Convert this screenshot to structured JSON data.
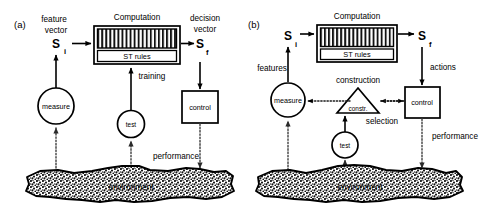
{
  "figure": {
    "panels": [
      {
        "tag": "(a)",
        "labels": {
          "input_caption_line1": "feature",
          "input_caption_line2": "vector",
          "input_symbol": "S",
          "input_subscript": "i",
          "output_caption_line1": "decision",
          "output_caption_line2": "vector",
          "output_symbol": "S",
          "output_subscript": "f",
          "computation": "Computation",
          "st_rules": "ST rules",
          "measure": "measure",
          "test": "test",
          "control": "control",
          "environment": "environment",
          "training": "training",
          "performance": "performance"
        }
      },
      {
        "tag": "(b)",
        "labels": {
          "input_caption": "features",
          "input_symbol": "S",
          "input_subscript": "i",
          "output_caption": "actions",
          "output_symbol": "S",
          "output_subscript": "f",
          "computation": "Computation",
          "st_rules": "ST rules",
          "measure": "measure",
          "test": "test",
          "control": "control",
          "constr": "constr.",
          "construction": "construction",
          "selection": "selection",
          "environment": "environment",
          "performance": "performance"
        }
      }
    ],
    "colors": {
      "stroke": "#000000",
      "background": "#ffffff",
      "dotted": "#4a4a4a",
      "stipple": "#111111"
    }
  }
}
